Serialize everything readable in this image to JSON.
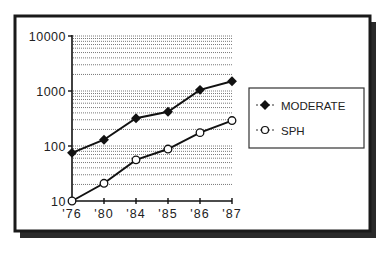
{
  "chart_data": {
    "type": "line",
    "title": "",
    "xlabel": "",
    "ylabel": "",
    "yscale": "log",
    "ylim": [
      10,
      10000
    ],
    "yticks": [
      10,
      100,
      1000,
      10000
    ],
    "ytick_labels": [
      "10",
      "100",
      "1000",
      "10000"
    ],
    "categories": [
      "'76",
      "'80",
      "'84",
      "'85",
      "'86",
      "'87"
    ],
    "grid": "dotted horizontal minor log gridlines",
    "legend_position": "right",
    "series": [
      {
        "name": "MODERATE",
        "marker": "filled-diamond",
        "values": [
          75,
          130,
          320,
          420,
          1050,
          1500
        ]
      },
      {
        "name": "SPH",
        "marker": "open-circle",
        "values": [
          10,
          21,
          56,
          88,
          175,
          290
        ]
      }
    ]
  },
  "legend": {
    "items": [
      {
        "label": "MODERATE",
        "marker": "filled-diamond-icon"
      },
      {
        "label": "SPH",
        "marker": "open-circle-icon"
      }
    ]
  },
  "colors": {
    "line": "#111111",
    "grid": "#555555",
    "frame": "#1a1a1a",
    "shadow": "#2a2a2a",
    "background": "#ffffff"
  }
}
